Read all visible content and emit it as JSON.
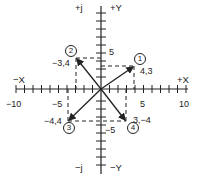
{
  "axes": {
    "pos_x_label": "+X",
    "neg_x_label": "−X",
    "pos_y_label": "+Y",
    "neg_y_label": "−Y",
    "pos_j_label": "+j",
    "neg_j_label": "−j",
    "x_ticks": [
      "−10",
      "−5",
      "5",
      "10"
    ],
    "y_ticks": [
      "5",
      "−5"
    ],
    "x_range": [
      -10,
      10
    ],
    "y_range": [
      -10,
      10
    ]
  },
  "vectors": [
    {
      "id": "1",
      "marker": "①",
      "label": "4,3",
      "x": 4,
      "y": 3
    },
    {
      "id": "2",
      "marker": "②",
      "label": "−3,4",
      "x": -3,
      "y": 4
    },
    {
      "id": "3",
      "marker": "③",
      "label": "−4,4",
      "x": -4,
      "y": -4
    },
    {
      "id": "4",
      "marker": "④",
      "label": "3,−4",
      "x": 3,
      "y": -4
    }
  ],
  "colors": {
    "line": "#222222",
    "background": "#ffffff"
  }
}
